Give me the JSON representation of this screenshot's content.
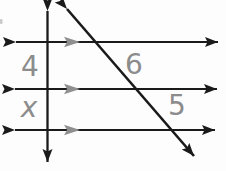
{
  "figure": {
    "labels": {
      "left_top_segment": "4",
      "left_bottom_segment": "x",
      "diagonal_top_segment": "6",
      "diagonal_bottom_segment": "5"
    },
    "colors": {
      "line": "#1a1a1a",
      "label": "#8c8c8c",
      "parallel_mark": "#8f8f8f",
      "background": "#fdfdfd",
      "artifact": "#c9c9c9"
    }
  }
}
